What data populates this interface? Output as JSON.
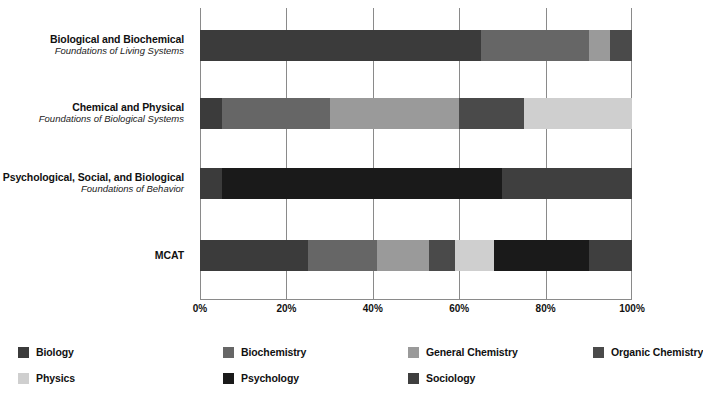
{
  "chart_data": {
    "type": "bar",
    "orientation": "horizontal",
    "stacked": true,
    "stack_mode": "percent",
    "title": "",
    "subtitle": "",
    "xlabel": "",
    "ylabel": "",
    "xlim": [
      0,
      100
    ],
    "xticks": [
      0,
      20,
      40,
      60,
      80,
      100
    ],
    "xtick_labels": [
      "0%",
      "20%",
      "40%",
      "60%",
      "80%",
      "100%"
    ],
    "grid": "vertical",
    "legend_position": "bottom-left",
    "categories": [
      {
        "title": "Biological and Biochemical",
        "subtitle": "Foundations of Living Systems"
      },
      {
        "title": "Chemical and Physical",
        "subtitle": "Foundations of Biological Systems"
      },
      {
        "title": "Psychological, Social, and Biological",
        "subtitle": "Foundations of Behavior"
      },
      {
        "title": "MCAT",
        "subtitle": ""
      }
    ],
    "series": [
      {
        "name": "Biology",
        "color": "#3b3b3b",
        "values": [
          65,
          5,
          5,
          25
        ]
      },
      {
        "name": "Biochemistry",
        "color": "#666666",
        "values": [
          25,
          25,
          0,
          16
        ]
      },
      {
        "name": "General Chemistry",
        "color": "#9a9a9a",
        "values": [
          5,
          30,
          0,
          12
        ]
      },
      {
        "name": "Organic Chemistry",
        "color": "#4a4a4a",
        "values": [
          5,
          15,
          0,
          6
        ]
      },
      {
        "name": "Physics",
        "color": "#cfcfcf",
        "values": [
          0,
          25,
          0,
          9
        ]
      },
      {
        "name": "Psychology",
        "color": "#1a1a1a",
        "values": [
          0,
          0,
          65,
          22
        ]
      },
      {
        "name": "Sociology",
        "color": "#3f3f3f",
        "values": [
          0,
          0,
          30,
          10
        ]
      }
    ],
    "stack_order_by_category": [
      [
        "Biology",
        "Biochemistry",
        "General Chemistry",
        "Organic Chemistry"
      ],
      [
        "Biology",
        "Biochemistry",
        "General Chemistry",
        "Organic Chemistry",
        "Physics"
      ],
      [
        "Biology",
        "Psychology",
        "Sociology"
      ],
      [
        "Biology",
        "Biochemistry",
        "General Chemistry",
        "Organic Chemistry",
        "Physics",
        "Psychology",
        "Sociology"
      ]
    ]
  },
  "legend": {
    "items": [
      {
        "label": "Biology",
        "color": "#3b3b3b"
      },
      {
        "label": "Biochemistry",
        "color": "#666666"
      },
      {
        "label": "General Chemistry",
        "color": "#9a9a9a"
      },
      {
        "label": "Organic Chemistry",
        "color": "#4a4a4a"
      },
      {
        "label": "Physics",
        "color": "#cfcfcf"
      },
      {
        "label": "Psychology",
        "color": "#1a1a1a"
      },
      {
        "label": "Sociology",
        "color": "#3f3f3f"
      }
    ]
  },
  "colors": {
    "gridline": "#8a8a8a",
    "background": "#ffffff",
    "text": "#111111"
  }
}
